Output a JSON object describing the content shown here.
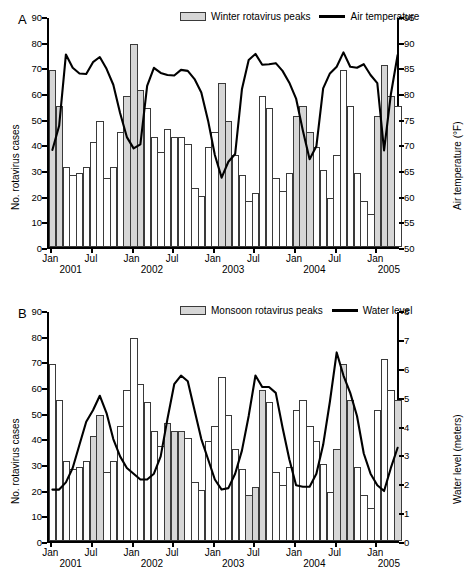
{
  "figure": {
    "caption": ""
  },
  "panels": [
    {
      "letter": "A",
      "left_axis": {
        "label": "No. rotavirus cases",
        "ticks": [
          "0",
          "10",
          "20",
          "30",
          "40",
          "50",
          "60",
          "70",
          "80",
          "90"
        ],
        "min": 0,
        "max": 90
      },
      "right_axis": {
        "label": "Air temperature (°F)",
        "ticks": [
          "50",
          "55",
          "60",
          "65",
          "70",
          "75",
          "80",
          "85",
          "90",
          "95"
        ],
        "min": 50,
        "max": 95
      },
      "legend": [
        {
          "type": "swatch",
          "label": "Winter rotavirus peaks"
        },
        {
          "type": "line",
          "label": "Air temperature"
        }
      ],
      "x_ticks": [
        {
          "label": "Jan",
          "index": 0
        },
        {
          "label": "Jul",
          "index": 6
        },
        {
          "label": "Jan",
          "index": 12
        },
        {
          "label": "Jul",
          "index": 18
        },
        {
          "label": "Jan",
          "index": 24
        },
        {
          "label": "Jul",
          "index": 30
        },
        {
          "label": "Jan",
          "index": 36
        },
        {
          "label": "Jul",
          "index": 42
        },
        {
          "label": "Jan",
          "index": 48
        }
      ],
      "x_years": [
        {
          "label": "2001",
          "index": 3
        },
        {
          "label": "2002",
          "index": 15
        },
        {
          "label": "2003",
          "index": 27
        },
        {
          "label": "2004",
          "index": 39
        },
        {
          "label": "2005",
          "index": 50
        }
      ]
    },
    {
      "letter": "B",
      "left_axis": {
        "label": "No. rotavirus cases",
        "ticks": [
          "0",
          "10",
          "20",
          "30",
          "40",
          "50",
          "60",
          "70",
          "80",
          "90"
        ],
        "min": 0,
        "max": 90
      },
      "right_axis": {
        "label": "Water level (meters)",
        "ticks": [
          "0",
          "1",
          "2",
          "3",
          "4",
          "5",
          "6",
          "7",
          "8"
        ],
        "min": 0,
        "max": 8
      },
      "legend": [
        {
          "type": "swatch",
          "label": "Monsoon rotavirus peaks"
        },
        {
          "type": "line",
          "label": "Water level"
        }
      ],
      "x_ticks": [
        {
          "label": "Jan",
          "index": 0
        },
        {
          "label": "Jul",
          "index": 6
        },
        {
          "label": "Jan",
          "index": 12
        },
        {
          "label": "Jul",
          "index": 18
        },
        {
          "label": "Jan",
          "index": 24
        },
        {
          "label": "Jul",
          "index": 30
        },
        {
          "label": "Jan",
          "index": 36
        },
        {
          "label": "Jul",
          "index": 42
        },
        {
          "label": "Jan",
          "index": 48
        }
      ],
      "x_years": [
        {
          "label": "2001",
          "index": 3
        },
        {
          "label": "2002",
          "index": 15
        },
        {
          "label": "2003",
          "index": 27
        },
        {
          "label": "2004",
          "index": 39
        },
        {
          "label": "2005",
          "index": 50
        }
      ]
    }
  ],
  "chart_data": [
    {
      "type": "bar",
      "title": "A",
      "xlabel": "",
      "ylabel": "No. rotavirus cases",
      "ylim": [
        0,
        90
      ],
      "y2label": "Air temperature (°F)",
      "y2lim": [
        50,
        95
      ],
      "grid": false,
      "legend_position": "top-center",
      "categories": [
        "Jan 2001",
        "Feb 2001",
        "Mar 2001",
        "Apr 2001",
        "May 2001",
        "Jun 2001",
        "Jul 2001",
        "Aug 2001",
        "Sep 2001",
        "Oct 2001",
        "Nov 2001",
        "Dec 2001",
        "Jan 2002",
        "Feb 2002",
        "Mar 2002",
        "Apr 2002",
        "May 2002",
        "Jun 2002",
        "Jul 2002",
        "Aug 2002",
        "Sep 2002",
        "Oct 2002",
        "Nov 2002",
        "Dec 2002",
        "Jan 2003",
        "Feb 2003",
        "Mar 2003",
        "Apr 2003",
        "May 2003",
        "Jun 2003",
        "Jul 2003",
        "Aug 2003",
        "Sep 2003",
        "Oct 2003",
        "Nov 2003",
        "Dec 2003",
        "Jan 2004",
        "Feb 2004",
        "Mar 2004",
        "Apr 2004",
        "May 2004",
        "Jun 2004",
        "Jul 2004",
        "Aug 2004",
        "Sep 2004",
        "Oct 2004",
        "Nov 2004",
        "Dec 2004",
        "Jan 2005",
        "Feb 2005",
        "Mar 2005",
        "Apr 2005"
      ],
      "series": [
        {
          "name": "No. rotavirus cases",
          "values": [
            69,
            55,
            31,
            28,
            29,
            31,
            41,
            49,
            27,
            31,
            45,
            59,
            79,
            61,
            54,
            43,
            37,
            46,
            43,
            43,
            40,
            23,
            20,
            39,
            45,
            64,
            49,
            36,
            28,
            18,
            21,
            59,
            54,
            27,
            22,
            29,
            51,
            55,
            45,
            39,
            30,
            19,
            36,
            69,
            55,
            29,
            18,
            13,
            51,
            71,
            59,
            55
          ]
        }
      ],
      "highlight_label": "Winter rotavirus peaks",
      "highlight_indices": [
        0,
        1,
        11,
        12,
        13,
        25,
        26,
        36,
        37,
        38,
        48,
        49,
        50
      ],
      "overlay": {
        "name": "Air temperature",
        "unit": "°F",
        "axis": "right",
        "values": [
          69.3,
          74.0,
          87.9,
          85.3,
          84.2,
          84.1,
          86.4,
          87.4,
          85.1,
          82.0,
          76.5,
          71.8,
          69.6,
          70.4,
          81.8,
          85.3,
          84.3,
          83.9,
          83.8,
          84.9,
          84.7,
          83.1,
          80.5,
          75.0,
          68.3,
          63.9,
          67.0,
          68.5,
          81.1,
          86.8,
          88.0,
          85.9,
          86.0,
          86.2,
          84.7,
          82.4,
          79.3,
          73.1,
          67.5,
          70.0,
          81.3,
          84.2,
          85.5,
          88.3,
          85.5,
          85.3,
          86.0,
          83.9,
          82.3,
          69.2,
          80.1,
          87.8
        ]
      }
    },
    {
      "type": "bar",
      "title": "B",
      "xlabel": "",
      "ylabel": "No. rotavirus cases",
      "ylim": [
        0,
        90
      ],
      "y2label": "Water level (meters)",
      "y2lim": [
        0,
        8
      ],
      "grid": false,
      "legend_position": "top-center",
      "categories": [
        "Jan 2001",
        "Feb 2001",
        "Mar 2001",
        "Apr 2001",
        "May 2001",
        "Jun 2001",
        "Jul 2001",
        "Aug 2001",
        "Sep 2001",
        "Oct 2001",
        "Nov 2001",
        "Dec 2001",
        "Jan 2002",
        "Feb 2002",
        "Mar 2002",
        "Apr 2002",
        "May 2002",
        "Jun 2002",
        "Jul 2002",
        "Aug 2002",
        "Sep 2002",
        "Oct 2002",
        "Nov 2002",
        "Dec 2002",
        "Jan 2003",
        "Feb 2003",
        "Mar 2003",
        "Apr 2003",
        "May 2003",
        "Jun 2003",
        "Jul 2003",
        "Aug 2003",
        "Sep 2003",
        "Oct 2003",
        "Nov 2003",
        "Dec 2003",
        "Jan 2004",
        "Feb 2004",
        "Mar 2004",
        "Apr 2004",
        "May 2004",
        "Jun 2004",
        "Jul 2004",
        "Aug 2004",
        "Sep 2004",
        "Oct 2004",
        "Nov 2004",
        "Dec 2004",
        "Jan 2005",
        "Feb 2005",
        "Mar 2005",
        "Apr 2005"
      ],
      "series": [
        {
          "name": "No. rotavirus cases",
          "values": [
            69,
            55,
            31,
            28,
            29,
            31,
            41,
            49,
            27,
            31,
            45,
            59,
            79,
            61,
            54,
            43,
            37,
            46,
            43,
            43,
            40,
            23,
            20,
            39,
            45,
            64,
            49,
            36,
            28,
            18,
            21,
            59,
            54,
            27,
            22,
            29,
            51,
            55,
            45,
            39,
            30,
            19,
            36,
            69,
            55,
            29,
            18,
            13,
            51,
            71,
            59,
            55
          ]
        }
      ],
      "highlight_label": "Monsoon rotavirus peaks",
      "highlight_indices": [
        6,
        7,
        17,
        18,
        19,
        29,
        30,
        31,
        42,
        43,
        44,
        51
      ],
      "overlay": {
        "name": "Water level",
        "unit": "meters",
        "axis": "right",
        "values": [
          1.85,
          1.85,
          2.1,
          2.6,
          3.4,
          4.2,
          4.6,
          5.1,
          4.5,
          3.6,
          3.0,
          2.6,
          2.4,
          2.2,
          2.2,
          2.4,
          3.0,
          4.3,
          5.5,
          5.8,
          5.6,
          4.6,
          3.6,
          2.9,
          2.2,
          1.85,
          1.9,
          2.4,
          3.2,
          4.4,
          5.8,
          5.4,
          5.4,
          5.2,
          4.0,
          2.9,
          2.0,
          1.95,
          1.95,
          2.4,
          3.4,
          4.9,
          6.6,
          5.8,
          5.2,
          4.4,
          3.1,
          2.4,
          2.0,
          1.8,
          2.6,
          3.3
        ]
      }
    }
  ]
}
